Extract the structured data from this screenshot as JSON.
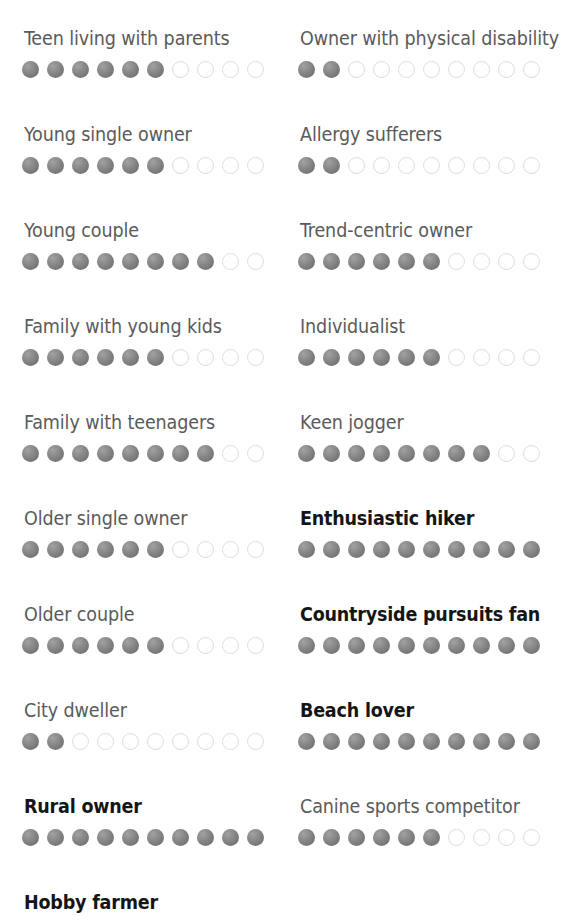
{
  "page": {
    "background_color": "#ffffff",
    "scale_max": 10,
    "filled_dot_color": "#7d7d7d",
    "empty_dot_ring_color": "#dcdcdc",
    "label_color": "#5a5a5a",
    "emphasis_label_color": "#151515"
  },
  "chart_data": {
    "type": "bar",
    "title": "",
    "subtitle": "",
    "xlabel": "",
    "ylabel": "",
    "ylim": [
      0,
      10
    ],
    "grid": false,
    "legend": "none",
    "scale_max": 10,
    "categories": [
      "Teen living with parents",
      "Young single owner",
      "Young couple",
      "Family with young kids",
      "Family with teenagers",
      "Older single owner",
      "Older couple",
      "City dweller",
      "Rural owner",
      "Hobby farmer",
      "Owner with physical disability",
      "Allergy sufferers",
      "Trend-centric owner",
      "Individualist",
      "Keen jogger",
      "Enthusiastic hiker",
      "Countryside pursuits fan",
      "Beach lover",
      "Canine sports competitor"
    ],
    "values": [
      6,
      6,
      8,
      6,
      8,
      6,
      6,
      2,
      10,
      null,
      2,
      2,
      6,
      6,
      8,
      10,
      10,
      10,
      6
    ]
  },
  "columns": {
    "left": {
      "rows": [
        {
          "label": "Teen living with parents",
          "filled": 6,
          "total": 10,
          "emphasis": false
        },
        {
          "label": "Young single owner",
          "filled": 6,
          "total": 10,
          "emphasis": false
        },
        {
          "label": "Young couple",
          "filled": 8,
          "total": 10,
          "emphasis": false
        },
        {
          "label": "Family with young kids",
          "filled": 6,
          "total": 10,
          "emphasis": false
        },
        {
          "label": "Family with teenagers",
          "filled": 8,
          "total": 10,
          "emphasis": false
        },
        {
          "label": "Older single owner",
          "filled": 6,
          "total": 10,
          "emphasis": false
        },
        {
          "label": "Older couple",
          "filled": 6,
          "total": 10,
          "emphasis": false
        },
        {
          "label": "City dweller",
          "filled": 2,
          "total": 10,
          "emphasis": false
        },
        {
          "label": "Rural owner",
          "filled": 10,
          "total": 10,
          "emphasis": true
        },
        {
          "label": "Hobby farmer",
          "filled": 0,
          "total": 0,
          "emphasis": true
        }
      ]
    },
    "right": {
      "rows": [
        {
          "label": "Owner with physical disability",
          "filled": 2,
          "total": 10,
          "emphasis": false
        },
        {
          "label": "Allergy sufferers",
          "filled": 2,
          "total": 10,
          "emphasis": false
        },
        {
          "label": "Trend-centric owner",
          "filled": 6,
          "total": 10,
          "emphasis": false
        },
        {
          "label": "Individualist",
          "filled": 6,
          "total": 10,
          "emphasis": false
        },
        {
          "label": "Keen jogger",
          "filled": 8,
          "total": 10,
          "emphasis": false
        },
        {
          "label": "Enthusiastic hiker",
          "filled": 10,
          "total": 10,
          "emphasis": true
        },
        {
          "label": "Countryside pursuits fan",
          "filled": 10,
          "total": 10,
          "emphasis": true
        },
        {
          "label": "Beach lover",
          "filled": 10,
          "total": 10,
          "emphasis": true
        },
        {
          "label": "Canine sports competitor",
          "filled": 6,
          "total": 10,
          "emphasis": false
        }
      ]
    }
  }
}
